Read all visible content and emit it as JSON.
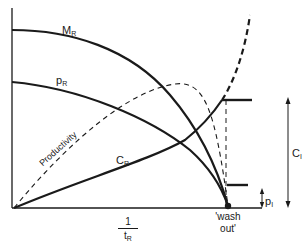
{
  "diagram": {
    "type": "chemostat-performance-curves",
    "colors": {
      "line": "#1a1a1a",
      "background": "#ffffff"
    },
    "axes": {
      "x_label_numerator": "1",
      "x_label_denominator": "t",
      "x_label_denominator_sub": "R",
      "y_axis": "unlabeled"
    },
    "curves": [
      {
        "id": "M_R",
        "label": "M",
        "sub": "R",
        "style": "solid",
        "shape": "decreasing concave, drops sharply to zero at wash out"
      },
      {
        "id": "p_R",
        "label": "p",
        "sub": "R",
        "style": "solid",
        "shape": "decreasing, reaches zero at wash out"
      },
      {
        "id": "C_R",
        "label": "C",
        "sub": "R",
        "style": "solid then dashed",
        "shape": "increasing from origin, becomes dashed beyond wash out region"
      },
      {
        "id": "productivity",
        "label": "Productivity",
        "style": "dashed",
        "shape": "rises from origin to maximum then falls to zero at wash out"
      }
    ],
    "annotations": {
      "wash_out_line1": "'wash",
      "wash_out_line2": "out'",
      "C_I_label": "C",
      "C_I_sub": "I",
      "p_I_label": "p",
      "p_I_sub": "I"
    }
  }
}
